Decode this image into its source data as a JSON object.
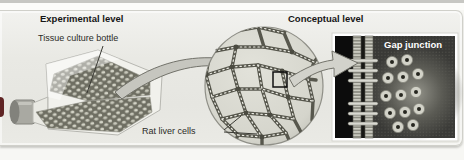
{
  "headers": {
    "experimental": "Experimental level",
    "conceptual": "Conceptual level"
  },
  "labels": {
    "tissue_culture_bottle": "Tissue culture bottle",
    "rat_liver_cells": "Rat liver cells",
    "gap_junction": "Gap junction"
  },
  "illustration": {
    "flask": {
      "name": "tissue-culture-bottle",
      "cells_texture_base": "#6e6e62",
      "cells_texture_dots": "#d3d3c6",
      "cap_color": "#a9a9a2"
    },
    "micrograph_circle": {
      "name": "rat-liver-cells-micrograph",
      "cell_fill": "#d9d9d1",
      "membrane_color": "#57574d",
      "bead_color": "#eeeee6"
    },
    "gap_junction_panel": {
      "bg_left": "#0c0c0c",
      "bg_right": "#393936",
      "membrane_rope": "#cfcfc5",
      "connexon_fill": "#d2d2c8",
      "connexon_pore": "#26261f"
    },
    "arrow_color": "#c6c6bf",
    "arrow_outline": "#72726a",
    "highlight_square_color": "#111111",
    "left_edge_accent": "#5f2424",
    "panel_bg": "#e9e9e4"
  }
}
